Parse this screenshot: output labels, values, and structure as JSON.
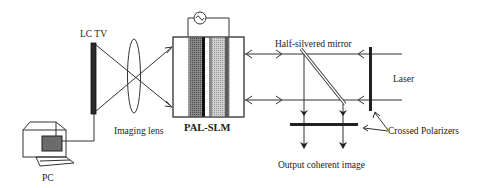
{
  "diagram": {
    "type": "optical-setup-schematic",
    "labels": {
      "lctv": "LC TV",
      "lens": "Imaging lens",
      "slm": "PAL-SLM",
      "mirror": "Half-silvered mirror",
      "laser": "Laser",
      "polarizers": "Crossed Polarizers",
      "output": "Output coherent image",
      "pc": "PC"
    },
    "components": [
      {
        "id": "pc",
        "label": "PC",
        "kind": "computer"
      },
      {
        "id": "lctv",
        "label": "LC TV",
        "kind": "display"
      },
      {
        "id": "lens",
        "label": "Imaging lens",
        "kind": "lens"
      },
      {
        "id": "slm",
        "label": "PAL-SLM",
        "kind": "spatial-light-modulator",
        "has_ac_source": true
      },
      {
        "id": "mirror",
        "label": "Half-silvered mirror",
        "kind": "beam-splitter"
      },
      {
        "id": "polarizers",
        "label": "Crossed Polarizers",
        "kind": "polarizer-pair"
      },
      {
        "id": "laser",
        "label": "Laser",
        "kind": "light-source"
      },
      {
        "id": "output",
        "label": "Output coherent image",
        "kind": "output"
      }
    ],
    "connections": [
      {
        "from": "pc",
        "to": "lctv",
        "kind": "cable"
      },
      {
        "from": "lctv",
        "to": "slm",
        "kind": "imaging-rays",
        "via": "lens"
      },
      {
        "from": "laser",
        "to": "mirror",
        "kind": "beam",
        "via": "polarizers"
      },
      {
        "from": "mirror",
        "to": "slm",
        "kind": "beam-bidirectional"
      },
      {
        "from": "mirror",
        "to": "output",
        "kind": "beam",
        "via": "polarizers"
      }
    ],
    "colors": {
      "line": "#333333",
      "dark_layer": "#222222",
      "photoconductor": "#7a7a7a",
      "liquid_crystal": "#bdbdbd",
      "pc_screen": "#666666"
    }
  }
}
